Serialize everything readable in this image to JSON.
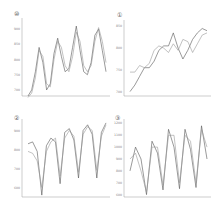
{
  "chart_data": [
    {
      "type": "line",
      "panel_label": "⑩",
      "title": "",
      "xlabel": "",
      "ylabel": "",
      "yticks": [
        700,
        750,
        800,
        850,
        900
      ],
      "ylim": [
        680,
        930
      ],
      "grid": false,
      "series": [
        {
          "name": "series A",
          "color": "#555555",
          "values": [
            680,
            700,
            760,
            840,
            790,
            700,
            720,
            820,
            870,
            810,
            760,
            770,
            840,
            910,
            830,
            760,
            750,
            790,
            880,
            900,
            830,
            760
          ]
        },
        {
          "name": "series B",
          "color": "#999999",
          "values": [
            675,
            690,
            740,
            830,
            810,
            720,
            710,
            800,
            860,
            840,
            780,
            760,
            810,
            890,
            860,
            780,
            760,
            780,
            860,
            905,
            860,
            790
          ]
        }
      ]
    },
    {
      "type": "line",
      "panel_label": "①",
      "title": "",
      "xlabel": "",
      "ylabel": "",
      "yticks": [
        700,
        750,
        800,
        850
      ],
      "ylim": [
        690,
        860
      ],
      "grid": false,
      "series": [
        {
          "name": "series A",
          "color": "#555555",
          "values": [
            700,
            715,
            735,
            755,
            755,
            770,
            795,
            805,
            805,
            835,
            800,
            775,
            795,
            820,
            835,
            845,
            840
          ]
        },
        {
          "name": "series B",
          "color": "#999999",
          "values": [
            745,
            745,
            760,
            755,
            765,
            795,
            805,
            800,
            790,
            810,
            795,
            820,
            815,
            790,
            810,
            830,
            835
          ]
        }
      ]
    },
    {
      "type": "line",
      "panel_label": "②",
      "title": "",
      "xlabel": "",
      "ylabel": "",
      "yticks": [
        600,
        700,
        800,
        900
      ],
      "ylim": [
        550,
        950
      ],
      "grid": false,
      "series": [
        {
          "name": "series A",
          "color": "#555555",
          "values": [
            830,
            840,
            790,
            560,
            820,
            860,
            840,
            620,
            890,
            910,
            850,
            650,
            900,
            930,
            880,
            650,
            890,
            940
          ]
        },
        {
          "name": "series B",
          "color": "#999999",
          "values": [
            790,
            780,
            740,
            600,
            790,
            840,
            860,
            660,
            860,
            900,
            870,
            680,
            880,
            920,
            900,
            690,
            870,
            930
          ]
        }
      ]
    },
    {
      "type": "line",
      "panel_label": "③",
      "title": "",
      "xlabel": "",
      "ylabel": "",
      "yticks": [
        600,
        700,
        800,
        900,
        1000,
        1100,
        1200
      ],
      "ylim": [
        580,
        1220
      ],
      "grid": false,
      "series": [
        {
          "name": "series A",
          "color": "#555555",
          "values": [
            800,
            1000,
            900,
            600,
            1050,
            950,
            640,
            1150,
            1000,
            650,
            1150,
            980,
            660,
            1180,
            900
          ]
        },
        {
          "name": "series B",
          "color": "#999999",
          "values": [
            900,
            950,
            800,
            620,
            1000,
            1000,
            680,
            1100,
            1100,
            700,
            1100,
            1050,
            700,
            1150,
            1000
          ]
        }
      ]
    }
  ]
}
